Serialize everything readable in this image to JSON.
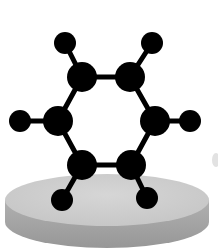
{
  "image": {
    "title": "Benzene molecule on pedestal",
    "subject": "benzene-molecule",
    "colors": {
      "background": "#ffffff",
      "atom": "#000000",
      "bond": "#000000",
      "disk_top": "#cfcfcf",
      "disk_side": "#a3a3a3",
      "disk_edge": "#bdbdbd"
    },
    "atoms": {
      "carbon": [
        {
          "x": 82,
          "y": 77
        },
        {
          "x": 130,
          "y": 77
        },
        {
          "x": 155,
          "y": 121
        },
        {
          "x": 131,
          "y": 165
        },
        {
          "x": 82,
          "y": 165
        },
        {
          "x": 58,
          "y": 121
        }
      ],
      "hydrogen": [
        {
          "x": 65,
          "y": 43
        },
        {
          "x": 152,
          "y": 43
        },
        {
          "x": 190,
          "y": 121
        },
        {
          "x": 147,
          "y": 198
        },
        {
          "x": 62,
          "y": 200
        },
        {
          "x": 20,
          "y": 121
        }
      ]
    }
  }
}
